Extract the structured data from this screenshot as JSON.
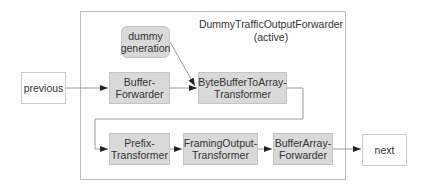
{
  "diagram": {
    "container_title": "DummyTrafficOutputForwarder",
    "container_subtitle": "(active)",
    "nodes": {
      "previous": "previous",
      "dummy_generation_line1": "dummy",
      "dummy_generation_line2": "generation",
      "buffer_forwarder_line1": "Buffer-",
      "buffer_forwarder_line2": "Forwarder",
      "bytebuffer_line1": "ByteBufferToArray-",
      "bytebuffer_line2": "Transformer",
      "prefix_line1": "Prefix-",
      "prefix_line2": "Transformer",
      "framing_line1": "FramingOutput-",
      "framing_line2": "Transformer",
      "bufferarray_line1": "BufferArray-",
      "bufferarray_line2": "Forwarder",
      "next": "next"
    },
    "edges": [
      {
        "from": "previous",
        "to": "Buffer-Forwarder"
      },
      {
        "from": "Buffer-Forwarder",
        "to": "ByteBufferToArray-Transformer"
      },
      {
        "from": "dummy generation",
        "to": "ByteBufferToArray-Transformer"
      },
      {
        "from": "ByteBufferToArray-Transformer",
        "to": "Prefix-Transformer"
      },
      {
        "from": "Prefix-Transformer",
        "to": "FramingOutput-Transformer"
      },
      {
        "from": "FramingOutput-Transformer",
        "to": "BufferArray-Forwarder"
      },
      {
        "from": "BufferArray-Forwarder",
        "to": "next"
      }
    ]
  }
}
